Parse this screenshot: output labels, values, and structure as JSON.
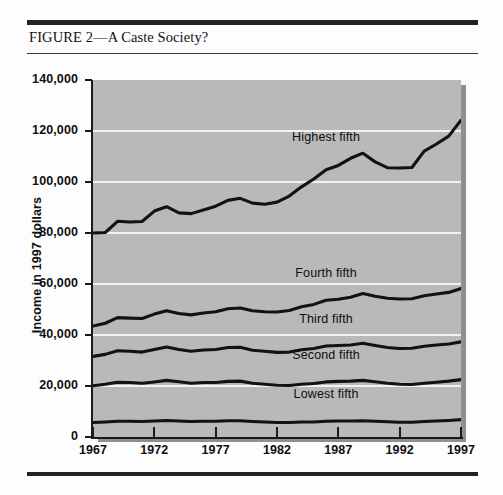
{
  "figure": {
    "caption": "FIGURE 2—A Caste Society?"
  },
  "chart_data": {
    "type": "line",
    "title": "FIGURE 2—A Caste Society?",
    "xlabel": "",
    "ylabel": "Income in 1997 dollars",
    "xlim": [
      1967,
      1997
    ],
    "ylim": [
      0,
      140000
    ],
    "ytick_labels": [
      "140,000",
      "120,000",
      "100,000",
      "80,000",
      "60,000",
      "40,000",
      "20,000",
      "0"
    ],
    "ytick_values": [
      140000,
      120000,
      100000,
      80000,
      60000,
      40000,
      20000,
      0
    ],
    "xtick_labels": [
      "1967",
      "1972",
      "1977",
      "1982",
      "1987",
      "1992",
      "1997"
    ],
    "xtick_values": [
      1967,
      1972,
      1977,
      1982,
      1987,
      1992,
      1997
    ],
    "grid": true,
    "legend_position": "inline-labels",
    "x": [
      1967,
      1968,
      1969,
      1970,
      1971,
      1972,
      1973,
      1974,
      1975,
      1976,
      1977,
      1978,
      1979,
      1980,
      1981,
      1982,
      1983,
      1984,
      1985,
      1986,
      1987,
      1988,
      1989,
      1990,
      1991,
      1992,
      1993,
      1994,
      1995,
      1996,
      1997
    ],
    "series": [
      {
        "name": "Highest fifth",
        "values": [
          80000,
          80200,
          84600,
          84300,
          84500,
          88600,
          90300,
          87900,
          87600,
          89000,
          90500,
          92800,
          93600,
          91700,
          91300,
          92100,
          94500,
          98100,
          101200,
          104800,
          106500,
          109300,
          111300,
          107900,
          105600,
          105500,
          105700,
          112100,
          114900,
          118000,
          124200
        ]
      },
      {
        "name": "Fourth fifth",
        "values": [
          43500,
          44600,
          46800,
          46600,
          46500,
          48200,
          49500,
          48400,
          47900,
          48600,
          49100,
          50300,
          50600,
          49500,
          49100,
          49000,
          49600,
          51100,
          52000,
          53600,
          54000,
          54800,
          56300,
          55200,
          54400,
          54100,
          54200,
          55400,
          56100,
          56700,
          58200
        ]
      },
      {
        "name": "Third fifth",
        "values": [
          31600,
          32400,
          33800,
          33600,
          33300,
          34300,
          35300,
          34300,
          33600,
          34100,
          34300,
          35100,
          35200,
          34000,
          33600,
          33200,
          33300,
          34200,
          34700,
          35700,
          35900,
          36100,
          36800,
          35900,
          35100,
          34700,
          34800,
          35600,
          36100,
          36500,
          37300
        ]
      },
      {
        "name": "Second fifth",
        "values": [
          20100,
          20700,
          21500,
          21400,
          21100,
          21600,
          22200,
          21700,
          21100,
          21400,
          21400,
          21800,
          21900,
          21100,
          20700,
          20300,
          20200,
          20700,
          21000,
          21600,
          21800,
          21900,
          22200,
          21700,
          21100,
          20700,
          20600,
          21100,
          21500,
          21900,
          22500
        ]
      },
      {
        "name": "Lowest fifth",
        "values": [
          5700,
          5900,
          6200,
          6200,
          6100,
          6300,
          6500,
          6300,
          6100,
          6200,
          6200,
          6400,
          6400,
          6100,
          5900,
          5700,
          5700,
          5900,
          5900,
          6200,
          6300,
          6300,
          6400,
          6200,
          6000,
          5800,
          5800,
          6100,
          6300,
          6500,
          6800
        ]
      }
    ]
  },
  "axis": {
    "y_title": "Income in 1997 dollars"
  }
}
